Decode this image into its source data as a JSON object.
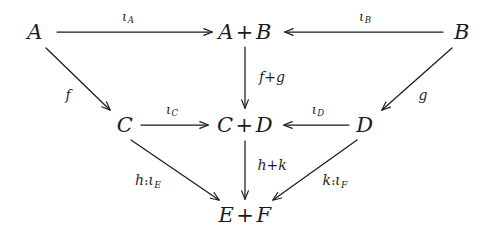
{
  "figure": {
    "kind": "commutative-diagram",
    "background_color": "#ffffff",
    "ink_color": "#1b1b1b",
    "width": 489,
    "height": 234
  },
  "nodes": [
    {
      "id": "A",
      "text": "A",
      "left": "A",
      "op": "",
      "right": "",
      "x": 35,
      "y": 32
    },
    {
      "id": "AB",
      "text": "A + B",
      "left": "A",
      "op": "+",
      "right": "B",
      "x": 245,
      "y": 32
    },
    {
      "id": "B",
      "text": "B",
      "left": "B",
      "op": "",
      "right": "",
      "x": 462,
      "y": 32
    },
    {
      "id": "C",
      "text": "C",
      "left": "C",
      "op": "",
      "right": "",
      "x": 125,
      "y": 125
    },
    {
      "id": "CD",
      "text": "C + D",
      "left": "C",
      "op": "+",
      "right": "D",
      "x": 245,
      "y": 125
    },
    {
      "id": "D",
      "text": "D",
      "left": "D",
      "op": "",
      "right": "",
      "x": 365,
      "y": 125
    },
    {
      "id": "EF",
      "text": "E + F",
      "left": "E",
      "op": "+",
      "right": "F",
      "x": 245,
      "y": 215
    }
  ],
  "edges": [
    {
      "id": "A-to-AB",
      "from": "A",
      "to": "AB",
      "label_text": "ιA",
      "label_base": "ι",
      "label_sub": "A",
      "kind": "iota-sub",
      "label_x": 128,
      "label_y": 17,
      "x1": 57,
      "y1": 32,
      "x2": 212,
      "y2": 32
    },
    {
      "id": "B-to-AB",
      "from": "B",
      "to": "AB",
      "label_text": "ιB",
      "label_base": "ι",
      "label_sub": "B",
      "kind": "iota-sub",
      "label_x": 365,
      "label_y": 17,
      "x1": 443,
      "y1": 32,
      "x2": 285,
      "y2": 32
    },
    {
      "id": "A-to-C",
      "from": "A",
      "to": "C",
      "label_text": "f",
      "label_base": "f",
      "label_sub": "",
      "kind": "plain",
      "label_x": 68,
      "label_y": 95,
      "x1": 44,
      "y1": 48,
      "x2": 110,
      "y2": 110
    },
    {
      "id": "B-to-D",
      "from": "B",
      "to": "D",
      "label_text": "g",
      "label_base": "g",
      "label_sub": "",
      "kind": "plain",
      "label_x": 423,
      "label_y": 95,
      "x1": 454,
      "y1": 48,
      "x2": 381,
      "y2": 110
    },
    {
      "id": "AB-to-CD",
      "from": "AB",
      "to": "CD",
      "label_text": "f+g",
      "label_base": "f",
      "label_sub": "",
      "label_op": "+",
      "label_tail": "g",
      "kind": "sum",
      "label_x": 272,
      "label_y": 77,
      "x1": 245,
      "y1": 47,
      "x2": 245,
      "y2": 109
    },
    {
      "id": "C-to-CD",
      "from": "C",
      "to": "CD",
      "label_text": "ιC",
      "label_base": "ι",
      "label_sub": "C",
      "kind": "iota-sub",
      "label_x": 172,
      "label_y": 110,
      "x1": 140,
      "y1": 125,
      "x2": 208,
      "y2": 125
    },
    {
      "id": "D-to-CD",
      "from": "D",
      "to": "CD",
      "label_text": "ιD",
      "label_base": "ι",
      "label_sub": "D",
      "kind": "iota-sub",
      "label_x": 318,
      "label_y": 110,
      "x1": 350,
      "y1": 125,
      "x2": 283,
      "y2": 125
    },
    {
      "id": "CD-to-EF",
      "from": "CD",
      "to": "EF",
      "label_text": "h+k",
      "label_base": "h",
      "label_sub": "",
      "label_op": "+",
      "label_tail": "k",
      "kind": "sum",
      "label_x": 272,
      "label_y": 165,
      "x1": 245,
      "y1": 140,
      "x2": 245,
      "y2": 200
    },
    {
      "id": "C-to-EF",
      "from": "C",
      "to": "EF",
      "label_text": "h⨾ιE",
      "label_base": "h",
      "label_comp": "⨾",
      "label_mid": "ι",
      "label_sub": "E",
      "kind": "composite",
      "label_x": 148,
      "label_y": 181,
      "x1": 131,
      "y1": 140,
      "x2": 218,
      "y2": 200
    },
    {
      "id": "D-to-EF",
      "from": "D",
      "to": "EF",
      "label_text": "k⨾ιF",
      "label_base": "k",
      "label_comp": "⨾",
      "label_mid": "ι",
      "label_sub": "F",
      "kind": "composite",
      "label_x": 335,
      "label_y": 181,
      "x1": 357,
      "y1": 140,
      "x2": 274,
      "y2": 200
    }
  ]
}
